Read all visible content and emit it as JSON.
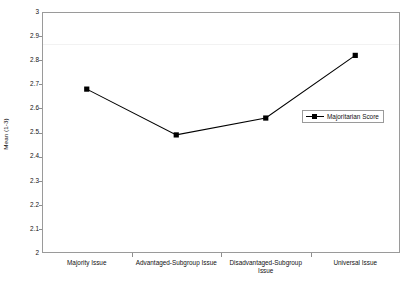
{
  "chart_data": {
    "type": "line",
    "title": "",
    "xlabel": "",
    "ylabel": "Mean (1-3)",
    "categories": [
      "Majority Issue",
      "Advantaged-Subgroup Issue",
      "Disadvantaged-Subgroup Issue",
      "Universal Issue"
    ],
    "series": [
      {
        "name": "Majoritarian Score",
        "values": [
          2.68,
          2.49,
          2.56,
          2.82
        ],
        "color": "#000000",
        "marker": "square"
      }
    ],
    "ylim": [
      2,
      3
    ],
    "ytick_values": [
      2,
      2.1,
      2.2,
      2.3,
      2.4,
      2.5,
      2.6,
      2.7,
      2.8,
      2.9,
      3
    ],
    "ytick_labels": [
      "2",
      "2.1",
      "2.2",
      "2.3",
      "2.4",
      "2.5",
      "2.6",
      "2.7",
      "2.8",
      "2.9",
      "3"
    ],
    "grid": true,
    "gridline_values": [
      2.87
    ],
    "legend_position": "inside-right"
  },
  "legend": {
    "entries": [
      {
        "label": "Majoritarian Score"
      }
    ]
  },
  "axis": {
    "y_title": "Mean (1-3)"
  },
  "colors": {
    "series": "#000000",
    "frame": "#9a9a9a",
    "gridline": "#f2f2f2",
    "tick": "#8e8e8e",
    "text": "#111111",
    "background": "#ffffff"
  }
}
